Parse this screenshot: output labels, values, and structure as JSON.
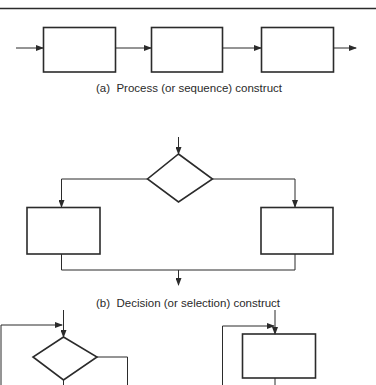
{
  "diagram": {
    "colors": {
      "line": "#2b2b2b",
      "box_stroke": "#2b2b2b",
      "background": "#ffffff"
    },
    "sections": [
      {
        "id": "a",
        "caption": "(a)  Process (or sequence) construct",
        "elements": [
          "process-box-1",
          "process-box-2",
          "process-box-3"
        ],
        "flow": "entry → box 1 → box 2 → box 3 → exit"
      },
      {
        "id": "b",
        "caption": "(b)  Decision (or selection) construct",
        "elements": [
          "decision-diamond",
          "left-branch-box",
          "right-branch-box"
        ],
        "flow": "entry → diamond → left/right branch boxes → merge → exit"
      },
      {
        "id": "c",
        "caption": "",
        "elements": [
          "loop-decision-diamond",
          "loop-process-box"
        ],
        "flow": "repetition constructs (partially visible)"
      }
    ]
  }
}
